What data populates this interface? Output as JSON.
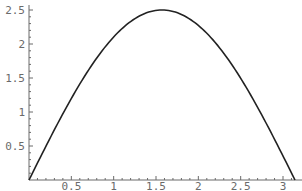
{
  "chart_data": {
    "type": "line",
    "title": "",
    "xlabel": "",
    "ylabel": "",
    "xlim": [
      0,
      3.1416
    ],
    "ylim": [
      0,
      2.5
    ],
    "grid": false,
    "legend": null,
    "x_ticks": [
      "0.5",
      "1",
      "1.5",
      "2",
      "2.5",
      "3"
    ],
    "y_ticks": [
      "0.5",
      "1",
      "1.5",
      "2",
      "2.5"
    ],
    "series": [
      {
        "name": "2.5 sin(x)",
        "x": [
          0,
          0.25,
          0.5,
          0.75,
          1.0,
          1.25,
          1.5,
          1.5708,
          1.75,
          2.0,
          2.25,
          2.5,
          2.75,
          3.0,
          3.1416
        ],
        "values": [
          0,
          0.62,
          1.2,
          1.7,
          2.1,
          2.37,
          2.49,
          2.5,
          2.46,
          2.27,
          1.95,
          1.5,
          0.95,
          0.35,
          0
        ]
      }
    ]
  },
  "layout": {
    "x0_px": 29,
    "x_unit_px": 84.67,
    "y0_px": 180,
    "y_unit_px": 68
  }
}
